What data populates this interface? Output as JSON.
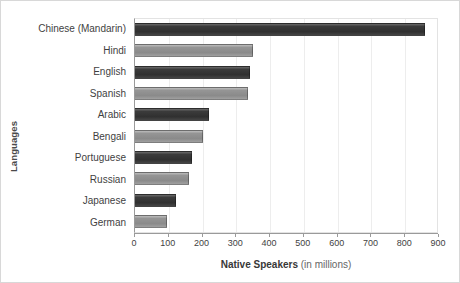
{
  "chart_data": {
    "type": "bar",
    "orientation": "horizontal",
    "title": "",
    "xlabel": "Native Speakers (in millions)",
    "xlabel_bold_part": "Native Speakers",
    "xlabel_light_part": "(in millions)",
    "ylabel": "Languages",
    "categories": [
      "Chinese (Mandarin)",
      "Hindi",
      "English",
      "Spanish",
      "Arabic",
      "Bengali",
      "Portuguese",
      "Russian",
      "Japanese",
      "German"
    ],
    "values": [
      860,
      350,
      340,
      335,
      220,
      200,
      170,
      160,
      120,
      95
    ],
    "xlim": [
      0,
      900
    ],
    "xticks": [
      0,
      100,
      200,
      300,
      400,
      500,
      600,
      700,
      800,
      900
    ],
    "xtick_labels": [
      "0",
      "100",
      "200",
      "300",
      "400",
      "500",
      "600",
      "700",
      "800",
      "900"
    ],
    "grid": true,
    "grid_axis": "x",
    "legend": "none",
    "bar_styles": [
      "dark",
      "light",
      "dark",
      "light",
      "dark",
      "light",
      "dark",
      "light",
      "dark",
      "light"
    ],
    "colors": {
      "bar_dark": "#3b3b3b",
      "bar_light": "#8f8f8f",
      "gridline": "#ededed",
      "axis": "#9a9a9a",
      "text": "#3f3f3f",
      "background": "#ffffff",
      "border": "#d8d8d8"
    }
  }
}
